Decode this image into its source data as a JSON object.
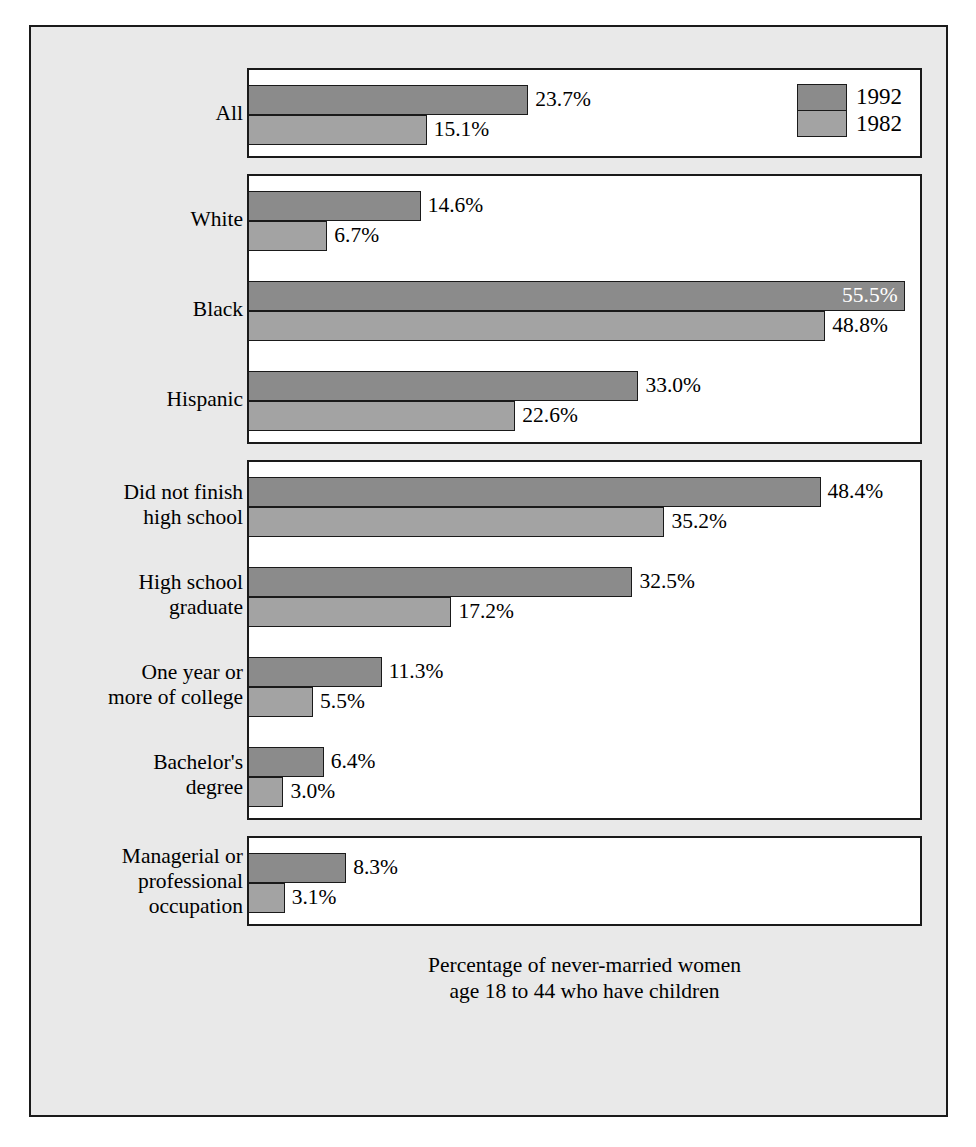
{
  "legend": {
    "entries": [
      {
        "label": "1992",
        "color": "#8b8b8b",
        "key": "y1992"
      },
      {
        "label": "1982",
        "color": "#a3a3a3",
        "key": "y1982"
      }
    ]
  },
  "caption": {
    "line1": "Percentage of never-married women",
    "line2": "age 18 to 44 who have children"
  },
  "chart_data": {
    "type": "bar",
    "orientation": "horizontal",
    "title": "",
    "subtitle": "",
    "xlabel": "Percentage of never-married women age 18 to 44 who have children",
    "ylabel": "",
    "xlim": [
      0,
      57
    ],
    "grid": false,
    "legend_position": "top-right",
    "value_suffix": "%",
    "series": [
      {
        "name": "1992",
        "color": "#8b8b8b"
      },
      {
        "name": "1982",
        "color": "#a3a3a3"
      }
    ],
    "panels": [
      {
        "name": "overall",
        "rows": [
          {
            "category": "All",
            "label_lines": [
              "All"
            ],
            "values": [
              {
                "series": "1992",
                "value": 23.7,
                "text": "23.7%",
                "label_inside": false
              },
              {
                "series": "1982",
                "value": 15.1,
                "text": "15.1%",
                "label_inside": false
              }
            ]
          }
        ]
      },
      {
        "name": "race-ethnicity",
        "rows": [
          {
            "category": "White",
            "label_lines": [
              "White"
            ],
            "values": [
              {
                "series": "1992",
                "value": 14.6,
                "text": "14.6%",
                "label_inside": false
              },
              {
                "series": "1982",
                "value": 6.7,
                "text": "6.7%",
                "label_inside": false
              }
            ]
          },
          {
            "category": "Black",
            "label_lines": [
              "Black"
            ],
            "values": [
              {
                "series": "1992",
                "value": 55.5,
                "text": "55.5%",
                "label_inside": true
              },
              {
                "series": "1982",
                "value": 48.8,
                "text": "48.8%",
                "label_inside": false
              }
            ]
          },
          {
            "category": "Hispanic",
            "label_lines": [
              "Hispanic"
            ],
            "values": [
              {
                "series": "1992",
                "value": 33.0,
                "text": "33.0%",
                "label_inside": false
              },
              {
                "series": "1982",
                "value": 22.6,
                "text": "22.6%",
                "label_inside": false
              }
            ]
          }
        ]
      },
      {
        "name": "education",
        "rows": [
          {
            "category": "Did not finish high school",
            "label_lines": [
              "Did not finish",
              "high school"
            ],
            "values": [
              {
                "series": "1992",
                "value": 48.4,
                "text": "48.4%",
                "label_inside": false
              },
              {
                "series": "1982",
                "value": 35.2,
                "text": "35.2%",
                "label_inside": false
              }
            ]
          },
          {
            "category": "High school graduate",
            "label_lines": [
              "High school",
              "graduate"
            ],
            "values": [
              {
                "series": "1992",
                "value": 32.5,
                "text": "32.5%",
                "label_inside": false
              },
              {
                "series": "1982",
                "value": 17.2,
                "text": "17.2%",
                "label_inside": false
              }
            ]
          },
          {
            "category": "One year or more of college",
            "label_lines": [
              "One year or",
              "more of college"
            ],
            "values": [
              {
                "series": "1992",
                "value": 11.3,
                "text": "11.3%",
                "label_inside": false
              },
              {
                "series": "1982",
                "value": 5.5,
                "text": "5.5%",
                "label_inside": false
              }
            ]
          },
          {
            "category": "Bachelor's degree",
            "label_lines": [
              "Bachelor's",
              "degree"
            ],
            "values": [
              {
                "series": "1992",
                "value": 6.4,
                "text": "6.4%",
                "label_inside": false
              },
              {
                "series": "1982",
                "value": 3.0,
                "text": "3.0%",
                "label_inside": false
              }
            ]
          }
        ]
      },
      {
        "name": "occupation",
        "rows": [
          {
            "category": "Managerial or professional occupation",
            "label_lines": [
              "Managerial or",
              "professional",
              "occupation"
            ],
            "values": [
              {
                "series": "1992",
                "value": 8.3,
                "text": "8.3%",
                "label_inside": false
              },
              {
                "series": "1982",
                "value": 3.1,
                "text": "3.1%",
                "label_inside": false
              }
            ]
          }
        ]
      }
    ]
  }
}
